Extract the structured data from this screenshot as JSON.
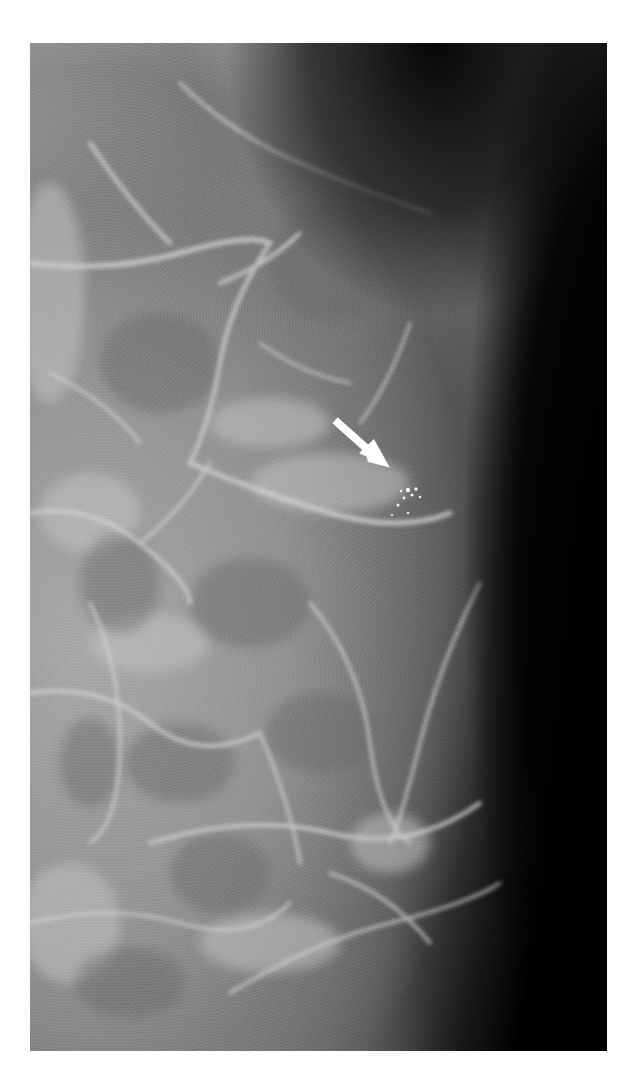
{
  "figure": {
    "image_type": "mammogram",
    "annotation": {
      "type": "arrow",
      "icon": "arrow-down-right-icon",
      "color": "#ffffff",
      "target": "microcalcification cluster"
    },
    "colors": {
      "background": "#000000",
      "tissue": "#9a9a9a",
      "page": "#ffffff"
    }
  },
  "caption": {
    "text": ""
  }
}
